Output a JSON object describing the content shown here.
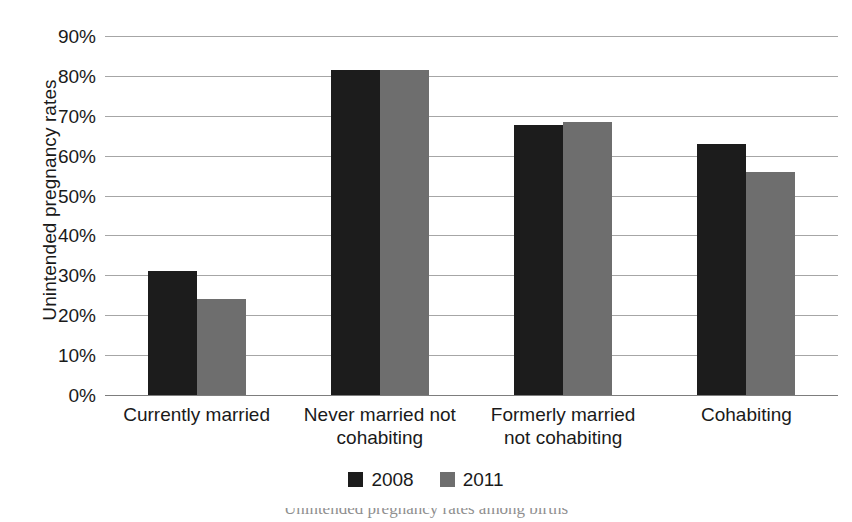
{
  "chart_data": {
    "type": "bar",
    "title": "",
    "xlabel": "",
    "ylabel": "Unintended pregnancy rates",
    "ylim": [
      0,
      90
    ],
    "ytick_labels": [
      "90%",
      "80%",
      "70%",
      "60%",
      "50%",
      "40%",
      "30%",
      "20%",
      "10%",
      "0%"
    ],
    "ytick_values": [
      90,
      80,
      70,
      60,
      50,
      40,
      30,
      20,
      10,
      0
    ],
    "grid": true,
    "legend_position": "bottom-center",
    "categories": [
      "Currently married",
      "Never married not cohabiting",
      "Formerly married not cohabiting",
      "Cohabiting"
    ],
    "category_lines": [
      [
        "Currently married"
      ],
      [
        "Never married not",
        "cohabiting"
      ],
      [
        "Formerly married",
        "not cohabiting"
      ],
      [
        "Cohabiting"
      ]
    ],
    "series": [
      {
        "name": "2008",
        "color": "#1c1c1c",
        "values": [
          31.0,
          81.5,
          67.8,
          63.0
        ]
      },
      {
        "name": "2011",
        "color": "#6e6e6e",
        "values": [
          24.0,
          81.5,
          68.5,
          55.8
        ]
      }
    ]
  },
  "legend": {
    "items": [
      {
        "label": "2008",
        "color": "#1c1c1c"
      },
      {
        "label": "2011",
        "color": "#6e6e6e"
      }
    ]
  },
  "caption": {
    "text": "Unintended pregnancy rates among births"
  },
  "colors": {
    "series_2008": "#1c1c1c",
    "series_2011": "#6e6e6e",
    "gridline": "#a6a6a6",
    "axis": "#7d7d7d",
    "text": "#1a1a1a",
    "background": "#ffffff"
  }
}
